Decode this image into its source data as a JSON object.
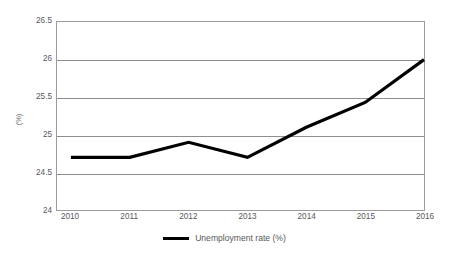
{
  "chart_data": {
    "type": "line",
    "title": "",
    "xlabel": "",
    "ylabel": "(%)",
    "categories": [
      "2010",
      "2011",
      "2012",
      "2013",
      "2014",
      "2015",
      "2016"
    ],
    "series": [
      {
        "name": "Unemployment rate (%)",
        "color": "#000000",
        "values": [
          24.7,
          24.7,
          24.9,
          24.7,
          25.1,
          25.43,
          26.0
        ]
      }
    ],
    "ylim": [
      24,
      26.5
    ],
    "yticks": [
      24,
      24.5,
      25,
      25.5,
      26,
      26.5
    ],
    "ytick_labels": [
      "24",
      "24.5",
      "25",
      "25.5",
      "26",
      "26.5"
    ],
    "grid": true,
    "grid_axis": "y",
    "legend_position": "bottom-center"
  },
  "legend": {
    "entries": [
      {
        "label": "Unemployment rate (%)",
        "color": "#000000"
      }
    ]
  },
  "colors": {
    "series": "#000000",
    "gridline": "#8e8e8e",
    "axis": "#9c9c9c",
    "tick_text": "#58585a",
    "background": "#ffffff"
  }
}
